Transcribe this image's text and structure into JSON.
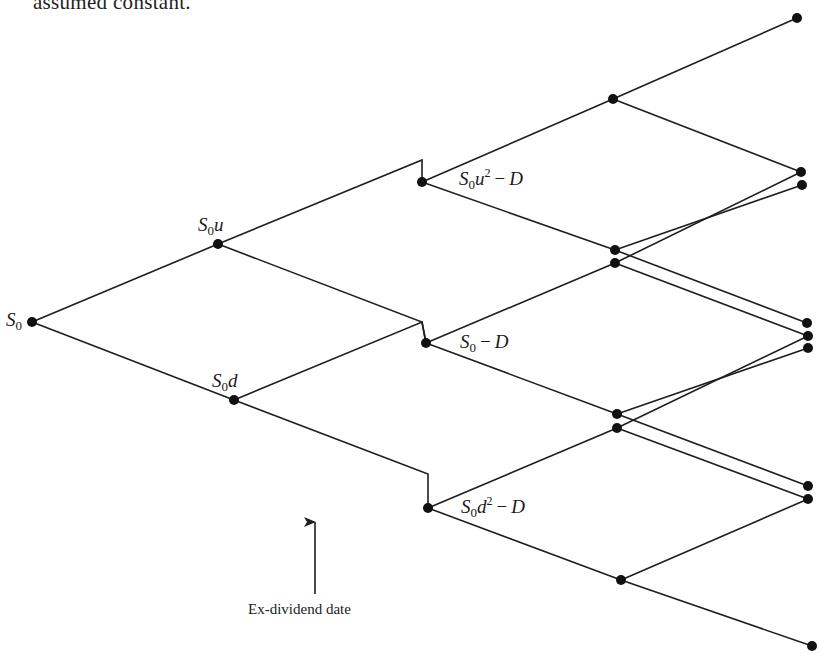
{
  "caption": "assumed constant.",
  "annotation": {
    "label": "Ex-dividend date",
    "arrow": {
      "x": 315,
      "y_from": 594,
      "y_to": 522
    }
  },
  "colors": {
    "line": "#1e1e1e",
    "node": "#111111",
    "text": "#1a1a1a",
    "background": "#ffffff"
  },
  "labels": {
    "s0": {
      "base": "S",
      "sub": "0",
      "tail": ""
    },
    "s0u": {
      "base": "S",
      "sub": "0",
      "tail": "u"
    },
    "s0d": {
      "base": "S",
      "sub": "0",
      "tail": "d"
    },
    "s0u2": {
      "base": "S",
      "sub": "0",
      "tail": "u",
      "sup": "2",
      "op": "−",
      "rest": "D"
    },
    "s0mD": {
      "base": "S",
      "sub": "0",
      "op": "−",
      "rest": "D"
    },
    "s0d2": {
      "base": "S",
      "sub": "0",
      "tail": "d",
      "sup": "2",
      "op": "−",
      "rest": "D"
    }
  },
  "nodes": [
    [
      32,
      322
    ],
    [
      218,
      244
    ],
    [
      234,
      400
    ],
    [
      422,
      182
    ],
    [
      426,
      343
    ],
    [
      428,
      508
    ],
    [
      613,
      99
    ],
    [
      615,
      250
    ],
    [
      615,
      263
    ],
    [
      617,
      414
    ],
    [
      617,
      428
    ],
    [
      621,
      580
    ],
    [
      797,
      18
    ],
    [
      801,
      172
    ],
    [
      802,
      185
    ],
    [
      807,
      323
    ],
    [
      808,
      336
    ],
    [
      808,
      348
    ],
    [
      808,
      486
    ],
    [
      808,
      499
    ],
    [
      812,
      646
    ]
  ],
  "edges": [
    [
      [
        32,
        322
      ],
      [
        218,
        244
      ]
    ],
    [
      [
        32,
        322
      ],
      [
        234,
        400
      ]
    ],
    [
      [
        218,
        244
      ],
      [
        422,
        160
      ],
      [
        422,
        182
      ]
    ],
    [
      [
        218,
        244
      ],
      [
        422,
        322
      ],
      [
        426,
        343
      ]
    ],
    [
      [
        234,
        400
      ],
      [
        422,
        322
      ],
      [
        426,
        343
      ]
    ],
    [
      [
        234,
        400
      ],
      [
        428,
        474
      ],
      [
        428,
        508
      ]
    ],
    [
      [
        422,
        182
      ],
      [
        613,
        99
      ]
    ],
    [
      [
        422,
        182
      ],
      [
        615,
        250
      ]
    ],
    [
      [
        426,
        343
      ],
      [
        615,
        263
      ]
    ],
    [
      [
        426,
        343
      ],
      [
        617,
        414
      ]
    ],
    [
      [
        428,
        508
      ],
      [
        617,
        428
      ]
    ],
    [
      [
        428,
        508
      ],
      [
        621,
        580
      ]
    ],
    [
      [
        613,
        99
      ],
      [
        797,
        18
      ]
    ],
    [
      [
        613,
        99
      ],
      [
        801,
        172
      ]
    ],
    [
      [
        615,
        250
      ],
      [
        802,
        185
      ]
    ],
    [
      [
        615,
        250
      ],
      [
        807,
        323
      ]
    ],
    [
      [
        615,
        263
      ],
      [
        801,
        172
      ]
    ],
    [
      [
        615,
        263
      ],
      [
        808,
        336
      ]
    ],
    [
      [
        617,
        414
      ],
      [
        808,
        348
      ]
    ],
    [
      [
        617,
        414
      ],
      [
        808,
        486
      ]
    ],
    [
      [
        617,
        428
      ],
      [
        808,
        336
      ]
    ],
    [
      [
        617,
        428
      ],
      [
        808,
        499
      ]
    ],
    [
      [
        621,
        580
      ],
      [
        808,
        499
      ]
    ],
    [
      [
        621,
        580
      ],
      [
        812,
        646
      ]
    ]
  ]
}
